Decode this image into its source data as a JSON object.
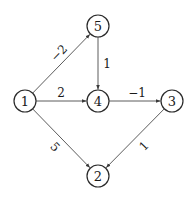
{
  "graph": {
    "type": "directed-weighted",
    "nodes": [
      {
        "id": "1",
        "label": "1",
        "x": 25,
        "y": 101
      },
      {
        "id": "5",
        "label": "5",
        "x": 98,
        "y": 26
      },
      {
        "id": "4",
        "label": "4",
        "x": 98,
        "y": 101
      },
      {
        "id": "3",
        "label": "3",
        "x": 172,
        "y": 101
      },
      {
        "id": "2",
        "label": "2",
        "x": 98,
        "y": 176
      }
    ],
    "node_radius": 11,
    "edges": [
      {
        "from": "1",
        "to": "5",
        "weight": "−2",
        "label_x": 59,
        "label_y": 53,
        "label_rotate": -46
      },
      {
        "from": "1",
        "to": "4",
        "weight": "2",
        "label_x": 61,
        "label_y": 93,
        "label_rotate": 0
      },
      {
        "from": "1",
        "to": "2",
        "weight": "5",
        "label_x": 55,
        "label_y": 147,
        "label_rotate": 46
      },
      {
        "from": "5",
        "to": "4",
        "weight": "1",
        "label_x": 107,
        "label_y": 64,
        "label_rotate": 0
      },
      {
        "from": "4",
        "to": "3",
        "weight": "−1",
        "label_x": 137,
        "label_y": 93,
        "label_rotate": 0
      },
      {
        "from": "3",
        "to": "2",
        "weight": "1",
        "label_x": 144,
        "label_y": 146,
        "label_rotate": -46
      }
    ],
    "colors": {
      "node_stroke": "#2a2a2a",
      "edge_stroke": "#4a4a4a",
      "text": "#1a1a1a",
      "background": "#ffffff"
    }
  }
}
